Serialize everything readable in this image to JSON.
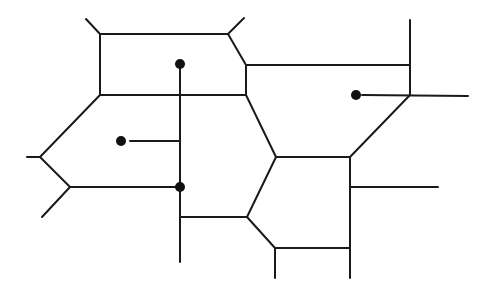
{
  "diagram": {
    "type": "voronoi-diagram",
    "background": "#ffffff",
    "stroke_color": "#1a1a1a",
    "site_color": "#111111",
    "sites": [
      {
        "id": "site-top",
        "x": 180,
        "y": 64,
        "r": 5
      },
      {
        "id": "site-left",
        "x": 121,
        "y": 141,
        "r": 5
      },
      {
        "id": "site-center",
        "x": 180,
        "y": 187,
        "r": 5
      },
      {
        "id": "site-right",
        "x": 356,
        "y": 95,
        "r": 5
      }
    ],
    "edges": [
      {
        "id": "e1",
        "x1": 100,
        "y1": 34,
        "x2": 228,
        "y2": 34
      },
      {
        "id": "e2",
        "x1": 100,
        "y1": 34,
        "x2": 86,
        "y2": 19
      },
      {
        "id": "e3",
        "x1": 228,
        "y1": 34,
        "x2": 244,
        "y2": 18
      },
      {
        "id": "e4",
        "x1": 100,
        "y1": 34,
        "x2": 100,
        "y2": 95
      },
      {
        "id": "e5",
        "x1": 228,
        "y1": 34,
        "x2": 246,
        "y2": 65
      },
      {
        "id": "e6",
        "x1": 246,
        "y1": 65,
        "x2": 246,
        "y2": 95
      },
      {
        "id": "e7",
        "x1": 100,
        "y1": 95,
        "x2": 246,
        "y2": 95
      },
      {
        "id": "e8",
        "x1": 246,
        "y1": 65,
        "x2": 410,
        "y2": 65
      },
      {
        "id": "e9",
        "x1": 410,
        "y1": 20,
        "x2": 410,
        "y2": 95
      },
      {
        "id": "e10",
        "x1": 362,
        "y1": 95,
        "x2": 468,
        "y2": 96
      },
      {
        "id": "e11",
        "x1": 410,
        "y1": 95,
        "x2": 350,
        "y2": 157
      },
      {
        "id": "e12",
        "x1": 100,
        "y1": 95,
        "x2": 40,
        "y2": 157
      },
      {
        "id": "e13",
        "x1": 27,
        "y1": 157,
        "x2": 40,
        "y2": 157
      },
      {
        "id": "e14",
        "x1": 40,
        "y1": 157,
        "x2": 70,
        "y2": 187
      },
      {
        "id": "e15",
        "x1": 70,
        "y1": 187,
        "x2": 42,
        "y2": 217
      },
      {
        "id": "e16",
        "x1": 70,
        "y1": 187,
        "x2": 180,
        "y2": 187
      },
      {
        "id": "e17",
        "x1": 130,
        "y1": 141,
        "x2": 180,
        "y2": 141
      },
      {
        "id": "e18",
        "x1": 180,
        "y1": 64,
        "x2": 180,
        "y2": 262
      },
      {
        "id": "e19",
        "x1": 246,
        "y1": 95,
        "x2": 276,
        "y2": 157
      },
      {
        "id": "e20",
        "x1": 276,
        "y1": 157,
        "x2": 350,
        "y2": 157
      },
      {
        "id": "e21",
        "x1": 276,
        "y1": 157,
        "x2": 247,
        "y2": 217
      },
      {
        "id": "e22",
        "x1": 180,
        "y1": 217,
        "x2": 247,
        "y2": 217
      },
      {
        "id": "e23",
        "x1": 247,
        "y1": 217,
        "x2": 275,
        "y2": 248
      },
      {
        "id": "e24",
        "x1": 275,
        "y1": 248,
        "x2": 350,
        "y2": 248
      },
      {
        "id": "e25",
        "x1": 275,
        "y1": 248,
        "x2": 275,
        "y2": 278
      },
      {
        "id": "e26",
        "x1": 350,
        "y1": 157,
        "x2": 350,
        "y2": 278
      },
      {
        "id": "e27",
        "x1": 350,
        "y1": 187,
        "x2": 438,
        "y2": 187
      }
    ]
  }
}
